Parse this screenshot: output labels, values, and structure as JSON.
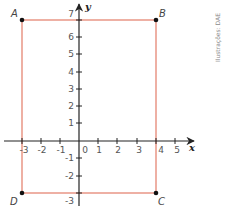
{
  "diagram": {
    "type": "coordinate-plane-rectangle",
    "axes": {
      "x_label": "x",
      "y_label": "y",
      "x_ticks": [
        "-3",
        "-2",
        "-1",
        "0",
        "1",
        "2",
        "3",
        "4",
        "5"
      ],
      "y_ticks_pos": [
        "1",
        "2",
        "3",
        "4",
        "5",
        "6",
        "7"
      ],
      "y_ticks_neg": [
        "-1",
        "-2",
        "-3"
      ],
      "origin_label": "0"
    },
    "rectangle": {
      "stroke_color": "#e0705a",
      "vertices": [
        {
          "label": "A",
          "x": -3,
          "y": 7
        },
        {
          "label": "B",
          "x": 4,
          "y": 7
        },
        {
          "label": "C",
          "x": 4,
          "y": -3
        },
        {
          "label": "D",
          "x": -3,
          "y": -3
        }
      ]
    },
    "credit": "Ilustrações: DAE"
  }
}
